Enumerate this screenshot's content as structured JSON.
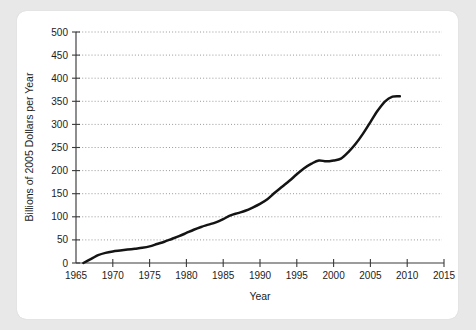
{
  "chart_data": {
    "type": "line",
    "title": "",
    "xlabel": "Year",
    "ylabel": "Billions of 2005 Dollars per Year",
    "xlim": [
      1965,
      2015
    ],
    "ylim": [
      0,
      500
    ],
    "xticks": [
      1965,
      1970,
      1975,
      1980,
      1985,
      1990,
      1995,
      2000,
      2005,
      2010,
      2015
    ],
    "yticks": [
      0,
      50,
      100,
      150,
      200,
      250,
      300,
      350,
      400,
      450,
      500
    ],
    "grid": "horizontal-dotted",
    "legend": "none",
    "line_color": "#141414",
    "series": [
      {
        "name": "Spending",
        "x": [
          1966.0,
          1966.6,
          1967.3,
          1968.0,
          1969.0,
          1970.0,
          1971.0,
          1972.0,
          1973.0,
          1974.0,
          1975.0,
          1976.0,
          1977.0,
          1978.0,
          1979.0,
          1980.0,
          1981.0,
          1982.0,
          1983.0,
          1984.0,
          1985.0,
          1986.0,
          1987.0,
          1988.0,
          1989.0,
          1990.0,
          1991.0,
          1992.0,
          1993.0,
          1994.0,
          1995.0,
          1996.0,
          1997.0,
          1998.0,
          1999.0,
          2000.0,
          2001.0,
          2002.0,
          2003.0,
          2004.0,
          2005.0,
          2006.0,
          2007.0,
          2008.0,
          2009.0
        ],
        "y": [
          0,
          5,
          11,
          17,
          22,
          25,
          27,
          29,
          31,
          33,
          36,
          41,
          46,
          52,
          58,
          65,
          72,
          78,
          83,
          88,
          95,
          103,
          108,
          113,
          120,
          128,
          138,
          152,
          165,
          178,
          192,
          205,
          215,
          222,
          220,
          222,
          226,
          240,
          258,
          280,
          305,
          330,
          350,
          360,
          361
        ]
      }
    ]
  },
  "axis_labels": {
    "y_title": "Billions of 2005 Dollars per Year",
    "x_title": "Year"
  }
}
